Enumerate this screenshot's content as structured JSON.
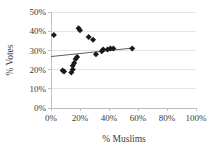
{
  "chart_data": {
    "type": "scatter",
    "title": "",
    "xlabel": "% Muslims",
    "ylabel": "% Votes",
    "xlim": [
      0,
      100
    ],
    "ylim": [
      0,
      50
    ],
    "grid": true,
    "legend": false,
    "x_ticks": [
      "0%",
      "20%",
      "40%",
      "60%",
      "80%",
      "100%"
    ],
    "x_tick_values": [
      0,
      20,
      40,
      60,
      80,
      100
    ],
    "y_ticks": [
      "0%",
      "10%",
      "20%",
      "30%",
      "40%",
      "50%"
    ],
    "y_tick_values": [
      0,
      10,
      20,
      30,
      40,
      50
    ],
    "marker_shape": "diamond",
    "marker_color": "#1a1a1a",
    "points": [
      {
        "x": 2,
        "y": 38.0
      },
      {
        "x": 8,
        "y": 19.5
      },
      {
        "x": 9,
        "y": 19.0
      },
      {
        "x": 14,
        "y": 18.5
      },
      {
        "x": 15,
        "y": 20.0
      },
      {
        "x": 15,
        "y": 22.0
      },
      {
        "x": 16,
        "y": 23.5
      },
      {
        "x": 17,
        "y": 25.5
      },
      {
        "x": 18,
        "y": 26.5
      },
      {
        "x": 19,
        "y": 41.5
      },
      {
        "x": 20,
        "y": 40.5
      },
      {
        "x": 26,
        "y": 37.0
      },
      {
        "x": 29,
        "y": 35.5
      },
      {
        "x": 31,
        "y": 28.0
      },
      {
        "x": 35,
        "y": 29.5
      },
      {
        "x": 36,
        "y": 30.5
      },
      {
        "x": 39,
        "y": 30.5
      },
      {
        "x": 41,
        "y": 31.0
      },
      {
        "x": 43,
        "y": 31.0
      },
      {
        "x": 56,
        "y": 31.0
      }
    ],
    "trendline": {
      "present": true,
      "x_start": 0,
      "y_start": 26.8,
      "x_end": 56,
      "y_end": 31.2,
      "color": "#4d4d4d"
    }
  }
}
